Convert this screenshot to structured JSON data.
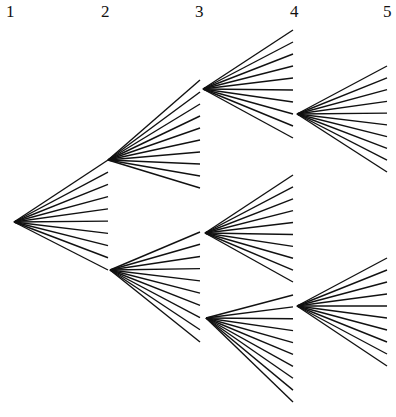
{
  "levels": [
    {
      "label": "1",
      "x": 6
    },
    {
      "label": "2",
      "x": 101
    },
    {
      "label": "3",
      "x": 195
    },
    {
      "label": "4",
      "x": 290
    },
    {
      "label": "5",
      "x": 383
    }
  ],
  "tree": {
    "branches_per_node": 10,
    "nodes": [
      {
        "id": "n1",
        "level": 1,
        "x": 14,
        "y": 222,
        "fan_x": 108,
        "fan_top": 160,
        "fan_bottom": 270
      },
      {
        "id": "n2a",
        "level": 2,
        "x": 108,
        "y": 160,
        "fan_x": 200,
        "fan_top": 80,
        "fan_bottom": 188
      },
      {
        "id": "n2b",
        "level": 2,
        "x": 110,
        "y": 270,
        "fan_x": 200,
        "fan_top": 232,
        "fan_bottom": 342
      },
      {
        "id": "n3a",
        "level": 3,
        "x": 203,
        "y": 89,
        "fan_x": 293,
        "fan_top": 30,
        "fan_bottom": 138
      },
      {
        "id": "n3b",
        "level": 3,
        "x": 205,
        "y": 233,
        "fan_x": 293,
        "fan_top": 175,
        "fan_bottom": 282
      },
      {
        "id": "n3c",
        "level": 3,
        "x": 206,
        "y": 318,
        "fan_x": 293,
        "fan_top": 295,
        "fan_bottom": 402
      },
      {
        "id": "n4a",
        "level": 4,
        "x": 297,
        "y": 114,
        "fan_x": 387,
        "fan_top": 66,
        "fan_bottom": 172
      },
      {
        "id": "n4b",
        "level": 4,
        "x": 297,
        "y": 306,
        "fan_x": 387,
        "fan_top": 258,
        "fan_bottom": 366
      }
    ]
  },
  "colors": {
    "line": "#111111",
    "background": "#ffffff"
  }
}
